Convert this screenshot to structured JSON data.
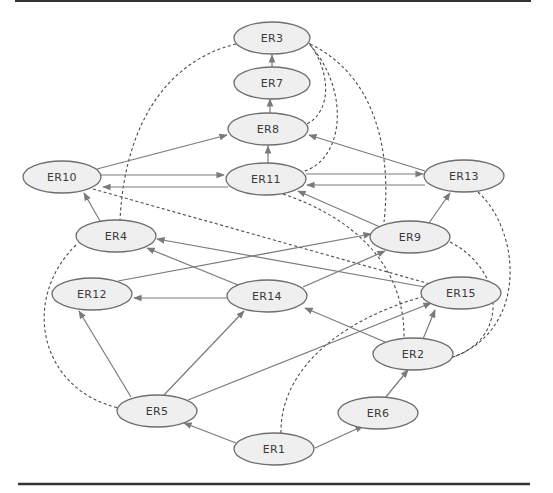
{
  "diagram": {
    "type": "directed-graph",
    "colors": {
      "node_fill": "#efefef",
      "node_stroke": "#6e6e6e",
      "edge": "#7a7a7a",
      "dashed_edge": "#4a4a4a",
      "rule": "#333333"
    },
    "nodes": [
      {
        "id": "ER3",
        "label": "ER3",
        "x": 272,
        "y": 38
      },
      {
        "id": "ER7",
        "label": "ER7",
        "x": 272,
        "y": 83
      },
      {
        "id": "ER8",
        "label": "ER8",
        "x": 268,
        "y": 129
      },
      {
        "id": "ER10",
        "label": "ER10",
        "x": 62,
        "y": 177
      },
      {
        "id": "ER11",
        "label": "ER11",
        "x": 266,
        "y": 179
      },
      {
        "id": "ER13",
        "label": "ER13",
        "x": 464,
        "y": 176
      },
      {
        "id": "ER4",
        "label": "ER4",
        "x": 116,
        "y": 236
      },
      {
        "id": "ER9",
        "label": "ER9",
        "x": 410,
        "y": 237
      },
      {
        "id": "ER12",
        "label": "ER12",
        "x": 92,
        "y": 294
      },
      {
        "id": "ER14",
        "label": "ER14",
        "x": 267,
        "y": 296
      },
      {
        "id": "ER15",
        "label": "ER15",
        "x": 461,
        "y": 293
      },
      {
        "id": "ER2",
        "label": "ER2",
        "x": 413,
        "y": 354
      },
      {
        "id": "ER5",
        "label": "ER5",
        "x": 157,
        "y": 411
      },
      {
        "id": "ER6",
        "label": "ER6",
        "x": 378,
        "y": 413
      },
      {
        "id": "ER1",
        "label": "ER1",
        "x": 274,
        "y": 449
      }
    ],
    "solid_edges": [
      {
        "from": "ER7",
        "to": "ER3"
      },
      {
        "from": "ER8",
        "to": "ER7"
      },
      {
        "from": "ER11",
        "to": "ER8"
      },
      {
        "from": "ER10",
        "to": "ER8"
      },
      {
        "from": "ER13",
        "to": "ER8"
      },
      {
        "from": "ER10",
        "to": "ER11"
      },
      {
        "from": "ER11",
        "to": "ER10"
      },
      {
        "from": "ER11",
        "to": "ER13"
      },
      {
        "from": "ER13",
        "to": "ER11"
      },
      {
        "from": "ER9",
        "to": "ER11"
      },
      {
        "from": "ER9",
        "to": "ER13"
      },
      {
        "from": "ER4",
        "to": "ER10"
      },
      {
        "from": "ER12",
        "to": "ER9"
      },
      {
        "from": "ER14",
        "to": "ER9"
      },
      {
        "from": "ER14",
        "to": "ER4"
      },
      {
        "from": "ER15",
        "to": "ER4"
      },
      {
        "from": "ER14",
        "to": "ER12"
      },
      {
        "from": "ER2",
        "to": "ER14"
      },
      {
        "from": "ER2",
        "to": "ER15"
      },
      {
        "from": "ER5",
        "to": "ER12"
      },
      {
        "from": "ER5",
        "to": "ER14"
      },
      {
        "from": "ER5",
        "to": "ER15"
      },
      {
        "from": "ER1",
        "to": "ER5"
      },
      {
        "from": "ER1",
        "to": "ER6"
      },
      {
        "from": "ER6",
        "to": "ER2"
      }
    ],
    "dashed_edges": [
      {
        "from": "ER3",
        "to": "ER4"
      },
      {
        "from": "ER3",
        "to": "ER8"
      },
      {
        "from": "ER3",
        "to": "ER11"
      },
      {
        "from": "ER3",
        "to": "ER9"
      },
      {
        "from": "ER10",
        "to": "ER15"
      },
      {
        "from": "ER11",
        "to": "ER2"
      },
      {
        "from": "ER13",
        "to": "ER2"
      },
      {
        "from": "ER9",
        "to": "ER2"
      },
      {
        "from": "ER4",
        "to": "ER5"
      },
      {
        "from": "ER1",
        "to": "ER15"
      }
    ]
  }
}
